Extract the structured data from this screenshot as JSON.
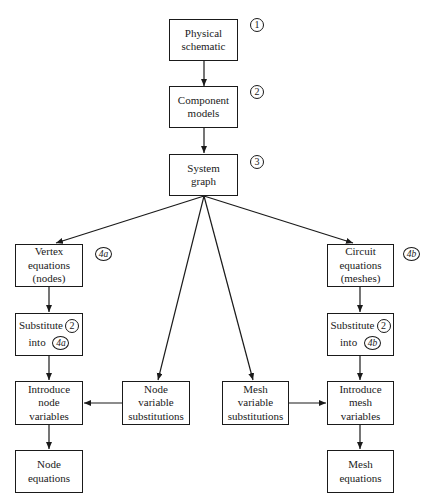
{
  "diagram": {
    "type": "flowchart",
    "nodes": {
      "physical": {
        "lines": [
          "Physical",
          "schematic"
        ],
        "tag": "1"
      },
      "component": {
        "lines": [
          "Component",
          "models"
        ],
        "tag": "2"
      },
      "system": {
        "lines": [
          "System",
          "graph"
        ],
        "tag": "3"
      },
      "vertex": {
        "lines": [
          "Vertex",
          "equations",
          "(nodes)"
        ],
        "tag": "4a"
      },
      "circuit": {
        "lines": [
          "Circuit",
          "equations",
          "(meshes)"
        ],
        "tag": "4b"
      },
      "subst_left": {
        "line1": "Substitute",
        "ref1": "2",
        "line2": "into",
        "ref2": "4a"
      },
      "subst_right": {
        "line1": "Substitute",
        "ref1": "2",
        "line2": "into",
        "ref2": "4b"
      },
      "intro_node": {
        "lines": [
          "Introduce",
          "node",
          "variables"
        ]
      },
      "node_subst": {
        "lines": [
          "Node",
          "variable",
          "substitutions"
        ]
      },
      "mesh_subst": {
        "lines": [
          "Mesh",
          "variable",
          "substitutions"
        ]
      },
      "intro_mesh": {
        "lines": [
          "Introduce",
          "mesh",
          "variables"
        ]
      },
      "node_eq": {
        "lines": [
          "Node",
          "equations"
        ]
      },
      "mesh_eq": {
        "lines": [
          "Mesh",
          "equations"
        ]
      }
    },
    "edges": [
      [
        "physical",
        "component"
      ],
      [
        "component",
        "system"
      ],
      [
        "system",
        "vertex"
      ],
      [
        "system",
        "node_subst"
      ],
      [
        "system",
        "mesh_subst"
      ],
      [
        "system",
        "circuit"
      ],
      [
        "vertex",
        "subst_left"
      ],
      [
        "subst_left",
        "intro_node"
      ],
      [
        "node_subst",
        "intro_node"
      ],
      [
        "intro_node",
        "node_eq"
      ],
      [
        "circuit",
        "subst_right"
      ],
      [
        "subst_right",
        "intro_mesh"
      ],
      [
        "mesh_subst",
        "intro_mesh"
      ],
      [
        "intro_mesh",
        "mesh_eq"
      ]
    ]
  }
}
